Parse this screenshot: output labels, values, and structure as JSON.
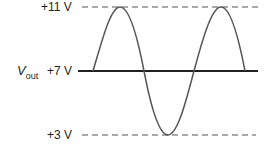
{
  "diagram": {
    "title": "",
    "signal_label": {
      "main": "V",
      "subscript": "out"
    },
    "levels": [
      {
        "label": "+11 V",
        "value": 11,
        "style": "dashed"
      },
      {
        "label": "+7 V",
        "value": 7,
        "style": "solid"
      },
      {
        "label": "+3 V",
        "value": 3,
        "style": "dashed"
      }
    ],
    "waveform": {
      "type": "sine",
      "dc_offset_v": 7,
      "amplitude_v": 4,
      "max_v": 11,
      "min_v": 3,
      "cycles_shown": 1.75,
      "starts_at": "dc level rising"
    },
    "colors": {
      "line": "#231f20",
      "wave": "#555555",
      "dashed": "#555555"
    }
  }
}
